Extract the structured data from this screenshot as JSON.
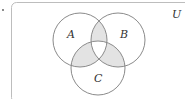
{
  "diagram": {
    "type": "venn",
    "universe_label": "U",
    "sets": [
      {
        "name": "A",
        "label": "A"
      },
      {
        "name": "B",
        "label": "B"
      },
      {
        "name": "C",
        "label": "C"
      }
    ],
    "shaded_regions": [
      "A∩B∩C'",
      "A∩C∩B'",
      "B∩C∩A'"
    ],
    "colors": {
      "shade": "#e3e3e3",
      "stroke": "#8a8a8a",
      "frame": "#bdbdbd"
    }
  },
  "marker": "."
}
